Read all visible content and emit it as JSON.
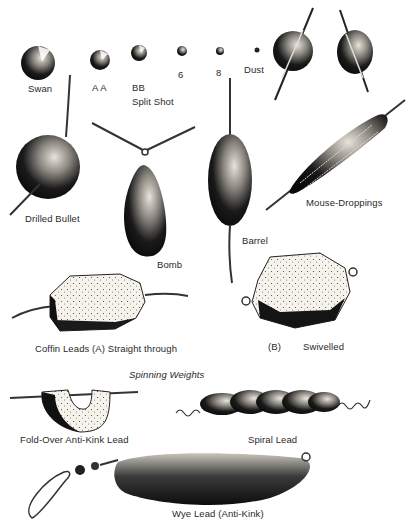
{
  "section_heading": "Spinning Weights",
  "colors": {
    "background": "#ffffff",
    "ink": "#111111",
    "label": "#2a2a2a",
    "stipple_light": "#f3f0e8"
  },
  "split_shot": {
    "group_label": "Split Shot",
    "sizes": [
      {
        "label": "Swan"
      },
      {
        "label": "A A"
      },
      {
        "label": "BB"
      },
      {
        "label": "6"
      },
      {
        "label": "8"
      },
      {
        "label": "Dust"
      }
    ]
  },
  "weights": [
    {
      "id": "drilled-bullet",
      "label": "Drilled Bullet"
    },
    {
      "id": "bomb",
      "label": "Bomb"
    },
    {
      "id": "barrel",
      "label": "Barrel"
    },
    {
      "id": "mouse-droppings",
      "label": "Mouse-Droppings"
    },
    {
      "id": "coffin-lead-a",
      "label": "Coffin Leads (A) Straight through"
    },
    {
      "id": "coffin-lead-b-marker",
      "label": "(B)"
    },
    {
      "id": "coffin-lead-b",
      "label": "Swivelled"
    },
    {
      "id": "fold-over",
      "label": "Fold-Over Anti-Kink Lead"
    },
    {
      "id": "spiral",
      "label": "Spiral Lead"
    },
    {
      "id": "wye",
      "label": "Wye Lead (Anti-Kink)"
    }
  ]
}
